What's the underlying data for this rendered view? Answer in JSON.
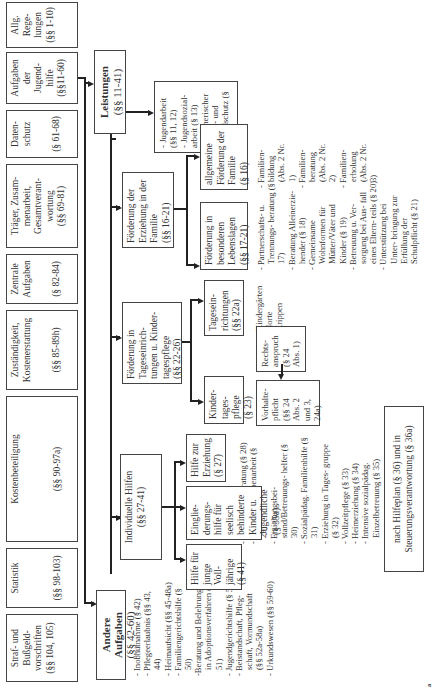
{
  "top_row": [
    {
      "label": "Allg. Rege- lungen",
      "ref": "(§§ 1-10)"
    },
    {
      "label": "Aufgaben der Jugend- hilfe",
      "ref": "(§§11-60)"
    },
    {
      "label": "Daten- schutz",
      "ref": "(§ 61-68)"
    },
    {
      "label": "Träger, Zusam- menarbeit, Gesamtverant- wortung",
      "ref": "(§§ 69-81)"
    },
    {
      "label": "Zentrale Aufgaben",
      "ref": "(§ 82-84)"
    },
    {
      "label": "Zuständigkeit, Kostenerstattung",
      "ref": "(§§ 85-89h)"
    },
    {
      "label": "Kostenbeteiligung",
      "ref": "(§§ 90-97a)"
    },
    {
      "label": "Statistik",
      "ref": "(§§ 98-103)"
    },
    {
      "label": "Straf- und Bußgeld- vorschriften",
      "ref": "(§§ 104, 105)"
    }
  ],
  "leistungen": {
    "title": "Leistungen",
    "ref": "(§§ 11-41)"
  },
  "andere_aufgaben": {
    "title": "Andere Aufgaben",
    "ref": "(§§ 42-60)",
    "items": [
      "- Inobhutnahme (§ 42)",
      "- Pflegeerlaubnis (§§ 43, 44)",
      "- Heimaufsicht (§§ 45-48a)",
      "- Familiengerichtshilfe (§ 50)",
      "-Beratung und Belehrung in Adoptionsverfahren (§ 51)",
      "- Jugendgerichtshilfe (§ 52)",
      "- Beistandschaft, Pfleg- schaft, Vormundschaft (§§ 52a-58a)",
      "- Urkundswesen (§§ 59-60)"
    ]
  },
  "jugendarbeit_list": [
    "- Jugendarbeit (§§ 11, 12)",
    "- Jugendsozial- arbeit (§ 13)",
    "- erzieherischer Kinder- und Jugendschutz (§ 14)"
  ],
  "familie": {
    "label": "Förderung der Erziehung in der Familie",
    "ref": "(§§ 16-21)",
    "children": [
      {
        "label": "allgemeine Förderung der Familie",
        "ref": "(§ 16)",
        "items": [
          "- Familien- bildung (Abs. 2 Nr. 1)",
          "- Familien- beratung (Abs. 2 Nr. 2)",
          "- Familien- erholung (Abs. 2 Nr. 3)"
        ]
      },
      {
        "label": "Förderung in besonderen Lebenslagen",
        "ref": "(§§ 17-21)",
        "items": [
          "- Partnerschafts- u. Trennungs- beratung (§ 17)",
          "- Beratung Alleinerzie- hender (§ 18)",
          "- Gemeinsame Wohnformen für Mütter/Väter und Kinder (§ 19)",
          "- Betreuung u. Ver- sorgung bei Aus- fall eines Eltern- teils (§ 20)",
          "- Unterstützung bei Unter- bringung zur Erfüllung der Schulpflicht (§ 21)"
        ]
      }
    ]
  },
  "tages": {
    "label": "Förderung in Tageseinrich- tungen u. Kinder- tagespflege",
    "ref": "(§§ 22-26)",
    "children": [
      {
        "label": "Tagesein- richtungen",
        "ref": "(§§ 22a)",
        "items": [
          "- Kindergärten",
          "- Horte",
          "- Krippen"
        ]
      },
      {
        "label": "Kinder- tages- pflege",
        "ref": "(§ 23)"
      }
    ],
    "rechtsanspruch": {
      "label": "Rechts- anspruch",
      "ref": "(§ 24 Abs. 1)"
    },
    "vorhaltepflicht": {
      "label": "Vorhalte- pflicht",
      "ref": "(§§ 24 Abs. 2 und 3, 24a)"
    }
  },
  "individuelle": {
    "label": "Individuelle Hilfen",
    "ref": "(§§ 27-41)",
    "children": [
      {
        "label": "Hilfe zur Erziehung",
        "ref": "(§ 27)",
        "items": [
          "- Erziehungs- beratung (§ 28)",
          "- Soziale Grup- penarbeit (§ 29)",
          "- Erziehungsbei- stand/Betreuungs- helfer (§ 30)",
          "- Sozialpädag. Familienhilfe (§ 31)",
          "- Erziehung in Tages- gruppe (§ 32)",
          "- Vollzeitpflege (§ 33)",
          "- Heimerziehung (§ 34)",
          "- Intensive sozialpädag. Einzelbetreuung (§ 35)"
        ]
      },
      {
        "label": "Eingliе- derungs- hilfe für seelisch behinderte Kinder u. Jugendliche",
        "ref": "(§ 35a)"
      },
      {
        "label": "Hilfe für junge Voll- jährige",
        "ref": "(§ 41)"
      }
    ],
    "hilfeplan": "nach Hilfeplan (§ 36) und in Steuerungsverantwortung (§ 36a)"
  },
  "figure_marker": "a"
}
